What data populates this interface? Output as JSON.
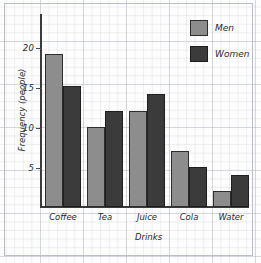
{
  "chart_data": {
    "type": "bar",
    "title": "",
    "xlabel": "Drinks",
    "ylabel": "Frequency (people)",
    "categories": [
      "Coffee",
      "Tea",
      "Juice",
      "Cola",
      "Water"
    ],
    "series": [
      {
        "name": "Men",
        "color": "#8d8d8d",
        "values": [
          19,
          10,
          12,
          7,
          2
        ]
      },
      {
        "name": "Women",
        "color": "#3b3b3b",
        "values": [
          15,
          12,
          14,
          5,
          4
        ]
      }
    ],
    "ylim": [
      0,
      23
    ],
    "yticks": [
      5,
      10,
      15,
      20
    ],
    "ytick_labels": [
      "5",
      "10",
      "15",
      "20"
    ],
    "grid": true,
    "grid_style": "graph-paper",
    "legend_position": "top-right"
  },
  "axis": {
    "y_title": "Frequency (people)",
    "x_title": "Drinks",
    "tick_5": "5",
    "tick_10": "10",
    "tick_15": "15",
    "tick_20": "20"
  },
  "categories": {
    "c0": "Coffee",
    "c1": "Tea",
    "c2": "Juice",
    "c3": "Cola",
    "c4": "Water"
  },
  "legend": {
    "men": "Men",
    "women": "Women"
  }
}
